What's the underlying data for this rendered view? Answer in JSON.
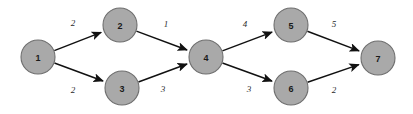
{
  "diagram": {
    "type": "directed-weighted-graph",
    "background_color": "#ffffff",
    "node_fill_color": "#a9a9a9",
    "node_stroke_color": "#6e6e6e",
    "edge_color": "#111111",
    "label_color": "#2b2b2b",
    "node_radius": 17,
    "nodes": [
      {
        "id": "1",
        "label": "1",
        "cx": 38,
        "cy": 57
      },
      {
        "id": "2",
        "label": "2",
        "cx": 120,
        "cy": 25
      },
      {
        "id": "3",
        "label": "3",
        "cx": 122,
        "cy": 88
      },
      {
        "id": "4",
        "label": "4",
        "cx": 206,
        "cy": 57
      },
      {
        "id": "5",
        "label": "5",
        "cx": 291,
        "cy": 25
      },
      {
        "id": "6",
        "label": "6",
        "cx": 291,
        "cy": 88
      },
      {
        "id": "7",
        "label": "7",
        "cx": 378,
        "cy": 58
      }
    ],
    "edges": [
      {
        "from": "1",
        "to": "2",
        "weight": "2",
        "lx": 73,
        "ly": 23
      },
      {
        "from": "1",
        "to": "3",
        "weight": "2",
        "lx": 73,
        "ly": 90
      },
      {
        "from": "2",
        "to": "4",
        "weight": "1",
        "lx": 166,
        "ly": 24
      },
      {
        "from": "3",
        "to": "4",
        "weight": "3",
        "lx": 163,
        "ly": 89
      },
      {
        "from": "4",
        "to": "5",
        "weight": "4",
        "lx": 245,
        "ly": 24
      },
      {
        "from": "4",
        "to": "6",
        "weight": "3",
        "lx": 249,
        "ly": 89
      },
      {
        "from": "5",
        "to": "7",
        "weight": "5",
        "lx": 334,
        "ly": 24
      },
      {
        "from": "6",
        "to": "7",
        "weight": "2",
        "lx": 334,
        "ly": 90
      }
    ]
  }
}
